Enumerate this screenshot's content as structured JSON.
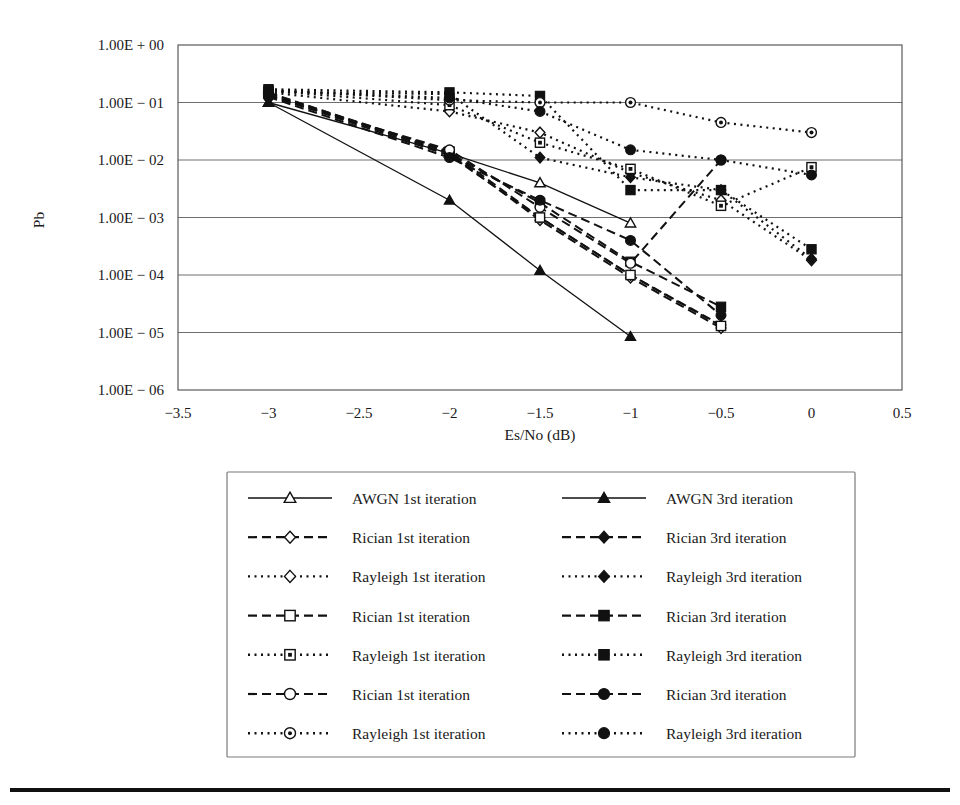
{
  "figure": {
    "background": "#ffffff",
    "line_color": "#111111",
    "grid_color": "#6e6e6e"
  },
  "axes": {
    "ylabel": "Pb",
    "xlabel": "Es/No (dB)",
    "x_ticks": [
      "−3.5",
      "−3",
      "−2.5",
      "−2",
      "−1.5",
      "−1",
      "−0.5",
      "0",
      "0.5"
    ],
    "y_ticks": [
      "1.00E + 00",
      "1.00E − 01",
      "1.00E − 02",
      "1.00E − 03",
      "1.00E − 04",
      "1.00E − 05",
      "1.00E − 06"
    ]
  },
  "legend": {
    "rows": [
      {
        "left": "AWGN 1st iteration",
        "left_marker": "triangle-open",
        "left_style": "solid",
        "right": "AWGN 3rd iteration",
        "right_marker": "triangle-fill",
        "right_style": "solid"
      },
      {
        "left": "Rician 1st iteration",
        "left_marker": "diamond-open",
        "left_style": "dashed",
        "right": "Rician 3rd iteration",
        "right_marker": "diamond-fill",
        "right_style": "dashed"
      },
      {
        "left": "Rayleigh 1st iteration",
        "left_marker": "diamond-open",
        "left_style": "dotted",
        "right": "Rayleigh 3rd iteration",
        "right_marker": "diamond-fill",
        "right_style": "dotted"
      },
      {
        "left": "Rician 1st iteration",
        "left_marker": "square-open",
        "left_style": "dashed",
        "right": "Rician 3rd iteration",
        "right_marker": "square-fill",
        "right_style": "dashed"
      },
      {
        "left": "Rayleigh 1st iteration",
        "left_marker": "square-half",
        "left_style": "dotted",
        "right": "Rayleigh 3rd iteration",
        "right_marker": "square-fill",
        "right_style": "dotted"
      },
      {
        "left": "Rician 1st iteration",
        "left_marker": "circle-open",
        "left_style": "dashed",
        "right": "Rician 3rd iteration",
        "right_marker": "circle-fill",
        "right_style": "dashed"
      },
      {
        "left": "Rayleigh 1st iteration",
        "left_marker": "circle-half",
        "left_style": "dotted",
        "right": "Rayleigh 3rd iteration",
        "right_marker": "circle-fill",
        "right_style": "dotted"
      }
    ]
  },
  "chart_data": {
    "type": "line",
    "title": "",
    "xlabel": "Es/No (dB)",
    "ylabel": "Pb",
    "yscale": "log",
    "xlim": [
      -3.5,
      0.5
    ],
    "ylim": [
      1e-06,
      1.0
    ],
    "grid": true,
    "legend_position": "below",
    "x_tick_values": [
      -3.5,
      -3,
      -2.5,
      -2,
      -1.5,
      -1,
      -0.5,
      0,
      0.5
    ],
    "y_tick_values": [
      1.0,
      0.1,
      0.01,
      0.001,
      0.0001,
      1e-05,
      1e-06
    ],
    "series": [
      {
        "name": "AWGN 1st iteration",
        "marker": "triangle-open",
        "style": "solid",
        "x": [
          -3,
          -2,
          -1.5,
          -1
        ],
        "values": [
          0.1,
          0.013,
          0.004,
          0.0008
        ]
      },
      {
        "name": "AWGN 3rd iteration",
        "marker": "triangle-fill",
        "style": "solid",
        "x": [
          -3,
          -2,
          -1.5,
          -1
        ],
        "values": [
          0.1,
          0.002,
          0.00012,
          8.5e-06
        ]
      },
      {
        "name": "Rician 1st iteration (diamond)",
        "marker": "diamond-open",
        "style": "dashed",
        "x": [
          -3,
          -2,
          -1.5,
          -1,
          -0.5
        ],
        "values": [
          0.14,
          0.013,
          0.0009,
          9e-05,
          1.2e-05
        ]
      },
      {
        "name": "Rician 3rd iteration (diamond)",
        "marker": "diamond-fill",
        "style": "dashed",
        "x": [
          -3,
          -2,
          -1.5,
          -1,
          -0.5
        ],
        "values": [
          0.135,
          0.012,
          0.001,
          0.0001,
          1.35e-05
        ]
      },
      {
        "name": "Rayleigh 1st iteration (diamond)",
        "marker": "diamond-open",
        "style": "dotted",
        "x": [
          -3,
          -2,
          -1.5,
          -1,
          -0.5,
          0
        ],
        "values": [
          0.15,
          0.07,
          0.03,
          0.006,
          0.002,
          0.00018
        ]
      },
      {
        "name": "Rayleigh 3rd iteration (diamond)",
        "marker": "diamond-fill",
        "style": "dotted",
        "x": [
          -3,
          -2,
          -1.5,
          -1,
          -0.5,
          0
        ],
        "values": [
          0.155,
          0.14,
          0.011,
          0.005,
          0.003,
          0.00019
        ]
      },
      {
        "name": "Rician 1st iteration (square)",
        "marker": "square-open",
        "style": "dashed",
        "x": [
          -3,
          -2,
          -1.5,
          -1,
          -0.5
        ],
        "values": [
          0.145,
          0.014,
          0.001,
          0.0001,
          1.3e-05
        ]
      },
      {
        "name": "Rician 3rd iteration (square)",
        "marker": "square-fill",
        "style": "dashed",
        "x": [
          -3,
          -2,
          -1.5,
          -1,
          -0.5
        ],
        "values": [
          0.15,
          0.013,
          0.0018,
          0.00017,
          2.8e-05
        ]
      },
      {
        "name": "Rayleigh 1st iteration (square)",
        "marker": "square-half",
        "style": "dotted",
        "x": [
          -3,
          -2,
          -1.5,
          -1,
          -0.5,
          0
        ],
        "values": [
          0.16,
          0.09,
          0.02,
          0.007,
          0.0016,
          0.0075
        ]
      },
      {
        "name": "Rayleigh 3rd iteration (square)",
        "marker": "square-fill",
        "style": "dotted",
        "x": [
          -3,
          -2,
          -1.5,
          -1,
          -0.5,
          0
        ],
        "values": [
          0.17,
          0.15,
          0.13,
          0.003,
          0.003,
          0.00028
        ]
      },
      {
        "name": "Rician 1st iteration (circle)",
        "marker": "circle-open",
        "style": "dashed",
        "x": [
          -3,
          -2,
          -1.5,
          -1,
          -0.5
        ],
        "values": [
          0.13,
          0.015,
          0.0015,
          0.00016,
          0.01
        ]
      },
      {
        "name": "Rician 3rd iteration (circle)",
        "marker": "circle-fill",
        "style": "dashed",
        "x": [
          -3,
          -2,
          -1.5,
          -1,
          -0.5
        ],
        "values": [
          0.125,
          0.011,
          0.002,
          0.0004,
          2e-05
        ]
      },
      {
        "name": "Rayleigh 1st iteration (circle)",
        "marker": "circle-half",
        "style": "dotted",
        "x": [
          -3,
          -2,
          -1.5,
          -1,
          -0.5,
          0
        ],
        "values": [
          0.165,
          0.11,
          0.1,
          0.1,
          0.045,
          0.03
        ]
      },
      {
        "name": "Rayleigh 3rd iteration (circle)",
        "marker": "circle-fill",
        "style": "dotted",
        "x": [
          -3,
          -2,
          -1.5,
          -1,
          -0.5,
          0
        ],
        "values": [
          0.16,
          0.12,
          0.07,
          0.015,
          0.01,
          0.0055
        ]
      }
    ]
  }
}
